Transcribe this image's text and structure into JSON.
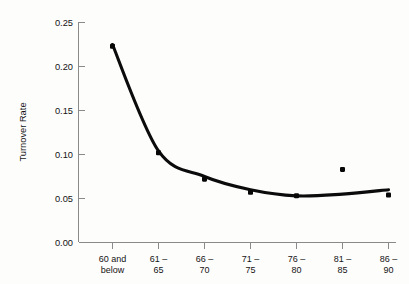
{
  "chart_data": {
    "type": "scatter",
    "title": "",
    "xlabel": "",
    "ylabel": "Turnover Rate",
    "categories": [
      "60 and below",
      "61 – 65",
      "66 – 70",
      "71 – 75",
      "76 – 80",
      "81 – 85",
      "86 – 90"
    ],
    "category_lines": [
      [
        "60 and",
        "below"
      ],
      [
        "61 –",
        "65"
      ],
      [
        "66 –",
        "70"
      ],
      [
        "71 –",
        "75"
      ],
      [
        "76 –",
        "80"
      ],
      [
        "81 –",
        "85"
      ],
      [
        "86 –",
        "90"
      ]
    ],
    "values": [
      0.223,
      0.102,
      0.072,
      0.057,
      0.053,
      0.083,
      0.054
    ],
    "series": [
      {
        "name": "Observed turnover rate",
        "type": "scatter",
        "values": [
          0.223,
          0.102,
          0.072,
          0.057,
          0.053,
          0.083,
          0.054
        ]
      },
      {
        "name": "Fitted curve",
        "type": "line",
        "values": [
          0.225,
          0.104,
          0.075,
          0.06,
          0.053,
          0.055,
          0.06
        ]
      }
    ],
    "ylim": [
      0.0,
      0.25
    ],
    "ytick_values": [
      0.25,
      0.2,
      0.15,
      0.1,
      0.05,
      0.0
    ],
    "ytick_labels": [
      "0.25",
      "0.20",
      "0.15",
      "0.10",
      "0.05",
      "0.00"
    ],
    "grid": false,
    "legend": "none",
    "annotations": [
      "Point at 81 – 85 lies above the fitted curve"
    ],
    "colors": {
      "curve": "#0b0b0b",
      "marker": "#070707",
      "axis": "#8a8a8a",
      "background": "#fdfdfc"
    }
  }
}
